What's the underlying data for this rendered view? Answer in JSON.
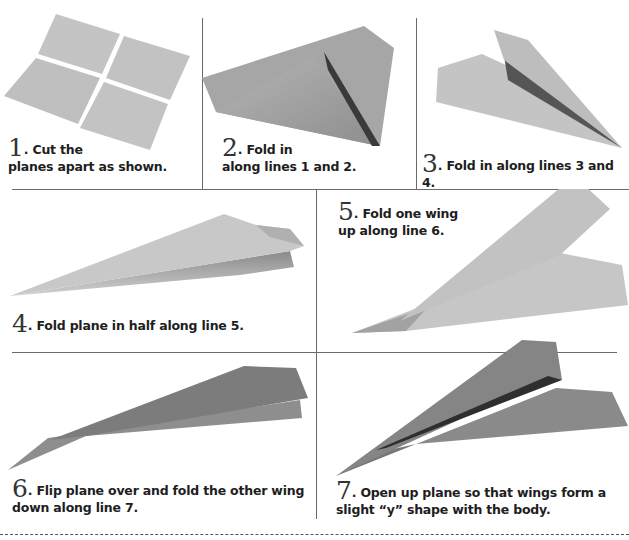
{
  "colors": {
    "paper_light": "#c9c9c9",
    "paper_mid": "#a8a8a8",
    "paper_dark": "#7a7a7a",
    "shadow": "#444444",
    "divider": "#6a6a6a"
  },
  "steps": [
    {
      "number": "1",
      "line1": "Cut the",
      "line2": "planes apart as shown.",
      "illustration": "four-paper-sheets"
    },
    {
      "number": "2",
      "line1": "Fold in",
      "line2": "along lines 1 and 2.",
      "illustration": "folded-corners-paper"
    },
    {
      "number": "3",
      "line1": "Fold in along lines 3 and 4.",
      "line2": "",
      "illustration": "narrow-folded-paper"
    },
    {
      "number": "4",
      "line1": "Fold plane in half along line 5.",
      "line2": "",
      "illustration": "half-folded-plane"
    },
    {
      "number": "5",
      "line1": "Fold one wing",
      "line2": "up along line 6.",
      "illustration": "one-wing-up-plane"
    },
    {
      "number": "6",
      "line1": "Flip plane over and fold the other wing",
      "line2": "down along line 7.",
      "illustration": "flipped-plane"
    },
    {
      "number": "7",
      "line1": "Open up plane so that wings form a",
      "line2": "slight “y” shape with the body.",
      "illustration": "finished-plane"
    }
  ]
}
